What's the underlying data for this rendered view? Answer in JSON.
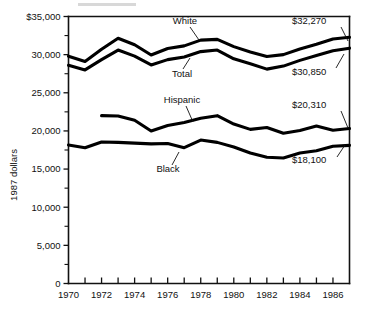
{
  "chart_data": {
    "type": "line",
    "title": "",
    "subtitle": "",
    "xlabel": "",
    "ylabel": "1987 dollars",
    "xlim": [
      1970,
      1987
    ],
    "ylim": [
      0,
      35000
    ],
    "grid": false,
    "legend_position": "inline-labels",
    "x": [
      1970,
      1971,
      1972,
      1973,
      1974,
      1975,
      1976,
      1977,
      1978,
      1979,
      1980,
      1981,
      1982,
      1983,
      1984,
      1985,
      1986,
      1987
    ],
    "y_ticks_major": [
      0,
      5000,
      10000,
      15000,
      20000,
      25000,
      30000,
      35000
    ],
    "y_tick_labels": [
      "0",
      "5,000",
      "10,000",
      "15,000",
      "20,000",
      "25,000",
      "30,000",
      "$35,000"
    ],
    "y_ticks_minor": [
      2500,
      7500,
      12500,
      17500,
      22500,
      27500,
      32500
    ],
    "x_tick_labels": [
      "1970",
      "1972",
      "1974",
      "1976",
      "1978",
      "1980",
      "1982",
      "1984",
      "1986"
    ],
    "x_tick_label_years": [
      1970,
      1972,
      1974,
      1976,
      1978,
      1980,
      1982,
      1984,
      1986
    ],
    "series": [
      {
        "name": "White",
        "label": "White",
        "start_year": 1970,
        "end_value_label": "$32,270",
        "values": [
          29800,
          29100,
          30700,
          32150,
          31300,
          29950,
          30800,
          31150,
          31900,
          32000,
          31050,
          30350,
          29750,
          30000,
          30750,
          31350,
          32050,
          32270
        ]
      },
      {
        "name": "Total",
        "label": "Total",
        "start_year": 1970,
        "end_value_label": "$30,850",
        "values": [
          28600,
          28000,
          29350,
          30600,
          29800,
          28650,
          29350,
          29700,
          30400,
          30600,
          29450,
          28800,
          28100,
          28500,
          29250,
          29900,
          30500,
          30850
        ]
      },
      {
        "name": "Hispanic",
        "label": "Hispanic",
        "start_year": 1972,
        "end_value_label": "$20,310",
        "values": [
          null,
          null,
          22000,
          21950,
          21400,
          20000,
          20700,
          21100,
          21650,
          22000,
          20900,
          20200,
          20450,
          19700,
          20050,
          20650,
          20100,
          20310
        ]
      },
      {
        "name": "Black",
        "label": "Black",
        "start_year": 1970,
        "end_value_label": "$18,100",
        "values": [
          18150,
          17800,
          18550,
          18500,
          18400,
          18300,
          18350,
          17800,
          18800,
          18500,
          17900,
          17100,
          16550,
          16450,
          17100,
          17400,
          18000,
          18100
        ]
      }
    ],
    "annotations": [
      {
        "text": "White",
        "kind": "series-label"
      },
      {
        "text": "Total",
        "kind": "series-label"
      },
      {
        "text": "Hispanic",
        "kind": "series-label"
      },
      {
        "text": "Black",
        "kind": "series-label"
      },
      {
        "text": "$32,270",
        "kind": "value-label"
      },
      {
        "text": "$30,850",
        "kind": "value-label"
      },
      {
        "text": "$20,310",
        "kind": "value-label"
      },
      {
        "text": "$18,100",
        "kind": "value-label"
      }
    ]
  },
  "axis": {
    "y_title": "1987 dollars"
  },
  "labels": {
    "white": "White",
    "total": "Total",
    "hispanic": "Hispanic",
    "black": "Black",
    "white_value": "$32,270",
    "total_value": "$30,850",
    "hispanic_value": "$20,310",
    "black_value": "$18,100"
  },
  "y_tick_text": {
    "t0": "0",
    "t5000": "5,000",
    "t10000": "10,000",
    "t15000": "15,000",
    "t20000": "20,000",
    "t25000": "25,000",
    "t30000": "30,000",
    "t35000": "$35,000"
  },
  "x_tick_text": {
    "t1970": "1970",
    "t1972": "1972",
    "t1974": "1974",
    "t1976": "1976",
    "t1978": "1978",
    "t1980": "1980",
    "t1982": "1982",
    "t1984": "1984",
    "t1986": "1986"
  },
  "colors": {
    "line": "#000000",
    "axis": "#111111",
    "background": "#ffffff"
  }
}
